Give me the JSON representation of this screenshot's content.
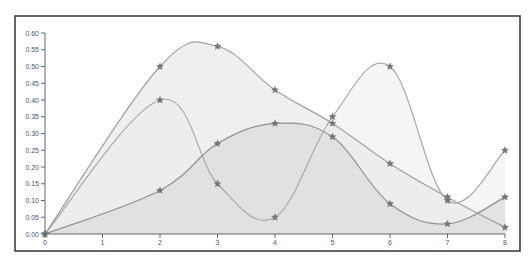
{
  "chart_data": {
    "type": "area",
    "title": "",
    "xlabel": "",
    "ylabel": "",
    "x": [
      0,
      2,
      3,
      4,
      5,
      6,
      7,
      8
    ],
    "xticks": [
      "0",
      "1",
      "2",
      "3",
      "4",
      "5",
      "6",
      "7",
      "8"
    ],
    "yticks": [
      "0.00",
      "0.05",
      "0.10",
      "0.15",
      "0.20",
      "0.25",
      "0.30",
      "0.35",
      "0.40",
      "0.45",
      "0.50",
      "0.55",
      "0.60"
    ],
    "xlim": [
      0,
      8
    ],
    "ylim": [
      0,
      0.6
    ],
    "grid": false,
    "legend": null,
    "marker": "star",
    "interpolation": "smooth",
    "series": [
      {
        "name": "Series 1",
        "values": [
          0.0,
          0.4,
          0.15,
          0.05,
          0.35,
          0.5,
          0.1,
          0.25
        ],
        "fill": "#f1f1f1",
        "line": "#a8a8a8"
      },
      {
        "name": "Series 2",
        "values": [
          0.0,
          0.5,
          0.56,
          0.43,
          0.33,
          0.21,
          0.11,
          0.02
        ],
        "fill": "#eaeaea",
        "line": "#a0a0a0"
      },
      {
        "name": "Series 3",
        "values": [
          0.0,
          0.13,
          0.27,
          0.33,
          0.29,
          0.09,
          0.03,
          0.11
        ],
        "fill": "#dcdcdc",
        "line": "#909090"
      }
    ],
    "colors": {
      "frame": "#333333",
      "axis": "#666666",
      "marker": "#777777",
      "background": "#ffffff"
    }
  }
}
